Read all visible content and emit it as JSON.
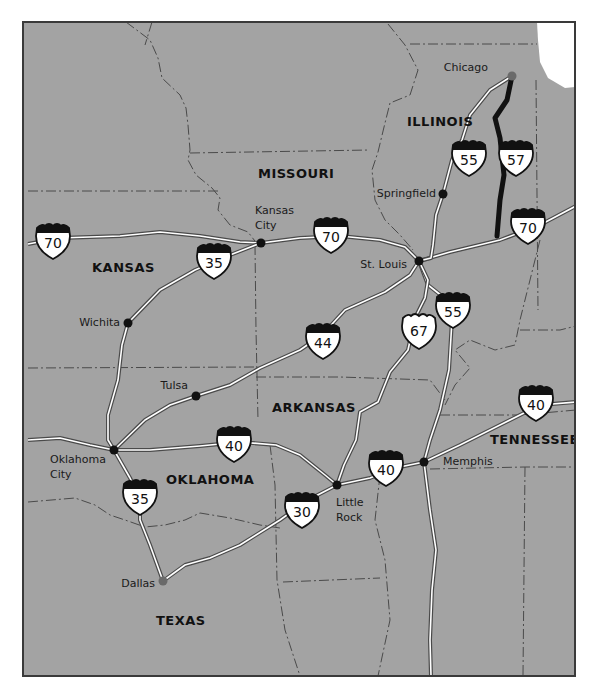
{
  "map": {
    "background_color": "#a3a3a3",
    "page_color": "#ffffff",
    "lake_color": "#ffffff",
    "border_color": "#3a3a3a",
    "road_color": "#ffffff",
    "road_casing": "#4a4a4a",
    "highlight_route_color": "#111111",
    "city_dot_color": "#111111",
    "major_city_dot_color": "#6a6a6a"
  },
  "states": [
    {
      "name": "MISSOURI",
      "x": 258,
      "y": 178
    },
    {
      "name": "ILLINOIS",
      "x": 407,
      "y": 126
    },
    {
      "name": "KANSAS",
      "x": 92,
      "y": 272
    },
    {
      "name": "ARKANSAS",
      "x": 272,
      "y": 412
    },
    {
      "name": "OKLAHOMA",
      "x": 166,
      "y": 484
    },
    {
      "name": "TENNESSEE",
      "x": 490,
      "y": 444
    },
    {
      "name": "TEXAS",
      "x": 156,
      "y": 625
    }
  ],
  "cities": [
    {
      "name": "Chicago",
      "line2": "",
      "x": 512,
      "y": 76,
      "lx": 488,
      "ly": 71,
      "anchor": "end",
      "major": true
    },
    {
      "name": "Springfield",
      "line2": "",
      "x": 443,
      "y": 194,
      "lx": 436,
      "ly": 197,
      "anchor": "end",
      "major": false
    },
    {
      "name": "Kansas",
      "line2": "City",
      "x": 261,
      "y": 243,
      "lx": 255,
      "ly": 214,
      "anchor": "start",
      "major": false
    },
    {
      "name": "St. Louis",
      "line2": "",
      "x": 419,
      "y": 261,
      "lx": 407,
      "ly": 268,
      "anchor": "end",
      "major": false
    },
    {
      "name": "Wichita",
      "line2": "",
      "x": 128,
      "y": 323,
      "lx": 120,
      "ly": 326,
      "anchor": "end",
      "major": false
    },
    {
      "name": "Tulsa",
      "line2": "",
      "x": 196,
      "y": 396,
      "lx": 188,
      "ly": 389,
      "anchor": "end",
      "major": false
    },
    {
      "name": "Oklahoma",
      "line2": "City",
      "x": 114,
      "y": 450,
      "lx": 50,
      "ly": 463,
      "anchor": "start",
      "major": false
    },
    {
      "name": "Memphis",
      "line2": "",
      "x": 424,
      "y": 462,
      "lx": 443,
      "ly": 465,
      "anchor": "start",
      "major": false
    },
    {
      "name": "Little",
      "line2": "Rock",
      "x": 337,
      "y": 485,
      "lx": 336,
      "ly": 506,
      "anchor": "start",
      "major": false
    },
    {
      "name": "Dallas",
      "line2": "",
      "x": 163,
      "y": 581,
      "lx": 155,
      "ly": 587,
      "anchor": "end",
      "major": true
    }
  ],
  "routes": [
    {
      "id": "I-70",
      "d": "M28,244 L60,238 L120,236 L160,232 L200,236 L240,242 L261,243 L300,238 L340,236 L380,240 L405,247 L419,261 L450,252 L500,240 L540,225 L576,206"
    },
    {
      "id": "I-55",
      "d": "M512,76 L490,90 L470,115 L462,140 L452,160 L443,194 L436,215 L433,245 L431,258 L419,261 L428,285 L447,300 L452,320 L449,370 L440,410 L430,440 L424,462 L430,510 L436,550 L432,590 L430,640 L431,676"
    },
    {
      "id": "I-44",
      "d": "M419,261 L410,275 L385,292 L345,310 L322,335 L300,350 L260,368 L230,385 L196,396 L170,405 L145,420 L114,450"
    },
    {
      "id": "US-67",
      "d": "M419,261 L428,280 L425,298 L415,318 L408,350 L390,372 L378,402 L360,412 L356,440 L344,465 L337,485"
    },
    {
      "id": "I-35",
      "d": "M261,243 L230,255 L195,270 L160,290 L128,323 L122,345 L118,380 L108,415 L108,440 L114,450 L130,478 L140,498 L140,520 L150,545 L163,581"
    },
    {
      "id": "I-40",
      "d": "M28,440 L60,438 L90,445 L114,450 L150,450 L200,446 L240,442 L276,445 L300,455 L325,475 L337,485 L370,478 L395,468 L424,462 L460,445 L500,425 L540,405 L576,402"
    },
    {
      "id": "I-30",
      "d": "M163,581 L185,565 L210,558 L240,545 L280,520 L308,500 L337,485"
    }
  ],
  "highlight_route": {
    "id": "I-57",
    "d": "M512,76 L507,100 L495,118 L500,138 L504,175 L500,200 L497,236"
  },
  "shields": [
    {
      "type": "interstate",
      "number": "70",
      "x": 53,
      "y": 240
    },
    {
      "type": "interstate",
      "number": "35",
      "x": 214,
      "y": 260
    },
    {
      "type": "interstate",
      "number": "70",
      "x": 331,
      "y": 234
    },
    {
      "type": "interstate",
      "number": "55",
      "x": 469,
      "y": 157
    },
    {
      "type": "interstate",
      "number": "57",
      "x": 516,
      "y": 157
    },
    {
      "type": "interstate",
      "number": "70",
      "x": 528,
      "y": 225
    },
    {
      "type": "interstate",
      "number": "55",
      "x": 453,
      "y": 309
    },
    {
      "type": "us",
      "number": "67",
      "x": 419,
      "y": 330
    },
    {
      "type": "interstate",
      "number": "44",
      "x": 323,
      "y": 340
    },
    {
      "type": "interstate",
      "number": "40",
      "x": 536,
      "y": 402
    },
    {
      "type": "interstate",
      "number": "40",
      "x": 234,
      "y": 443
    },
    {
      "type": "interstate",
      "number": "40",
      "x": 386,
      "y": 467
    },
    {
      "type": "interstate",
      "number": "35",
      "x": 140,
      "y": 496
    },
    {
      "type": "interstate",
      "number": "30",
      "x": 302,
      "y": 509
    }
  ]
}
